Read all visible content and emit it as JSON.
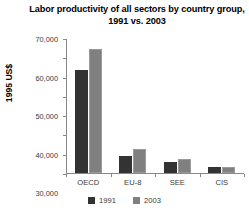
{
  "chart_data": {
    "type": "bar",
    "title": "Labor productivity of all sectors by country group, 1991 vs. 2003",
    "xlabel": "",
    "ylabel": "1995 US$",
    "categories": [
      "OECD",
      "EU-8",
      "SEE",
      "CIS"
    ],
    "series": [
      {
        "name": "1991",
        "color": "#333333",
        "values": [
          53500,
          9000,
          5700,
          3300
        ]
      },
      {
        "name": "2003",
        "color": "#808080",
        "values": [
          64300,
          12500,
          7200,
          3000
        ]
      }
    ],
    "ylim": [
      0,
      70000
    ],
    "yticks": [
      0,
      10000,
      20000,
      30000,
      40000,
      50000,
      60000,
      70000
    ],
    "ytick_labels": [
      "0",
      "10,000",
      "20,000",
      "30,000",
      "40,000",
      "50,000",
      "60,000",
      "70,000"
    ],
    "grid": false,
    "legend_position": "bottom"
  }
}
